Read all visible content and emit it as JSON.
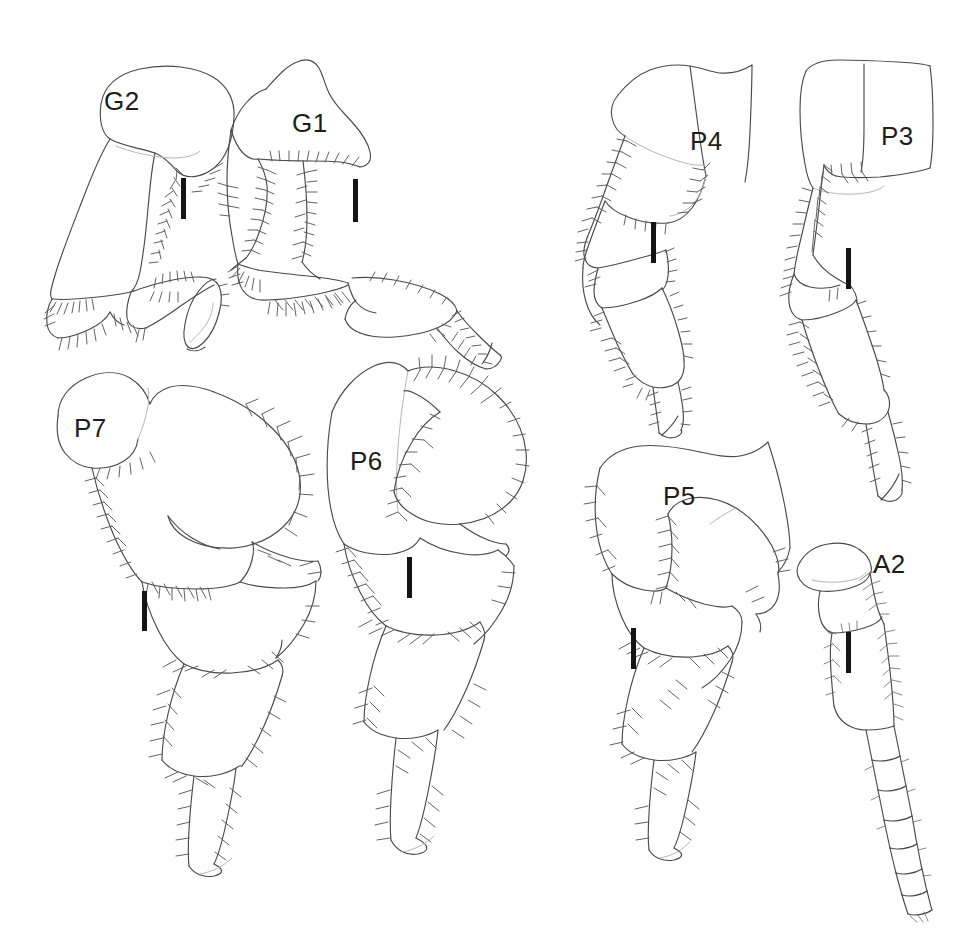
{
  "plate": {
    "title": "Amphipod appendage plate",
    "background_color": "#ffffff",
    "ink_color": "#4a4a4a",
    "scalebar_color": "#141414",
    "width": 970,
    "height": 948,
    "panel_count": 8
  },
  "panels": [
    {
      "id": "g2",
      "label": "G2",
      "name": "gnathopod-2",
      "label_x": 104,
      "label_y": 88,
      "scalebar": {
        "x": 181,
        "y": 178,
        "width": 5,
        "height": 41
      }
    },
    {
      "id": "g1",
      "label": "G1",
      "name": "gnathopod-1",
      "label_x": 292,
      "label_y": 110,
      "scalebar": {
        "x": 353,
        "y": 179,
        "width": 5,
        "height": 43
      }
    },
    {
      "id": "p4",
      "label": "P4",
      "name": "pereopod-4",
      "label_x": 690,
      "label_y": 128,
      "scalebar": {
        "x": 651,
        "y": 222,
        "width": 5,
        "height": 41
      }
    },
    {
      "id": "p3",
      "label": "P3",
      "name": "pereopod-3",
      "label_x": 881,
      "label_y": 123,
      "scalebar": {
        "x": 846,
        "y": 248,
        "width": 5,
        "height": 41
      }
    },
    {
      "id": "p7",
      "label": "P7",
      "name": "pereopod-7",
      "label_x": 74,
      "label_y": 415,
      "scalebar": {
        "x": 142,
        "y": 591,
        "width": 5,
        "height": 40
      }
    },
    {
      "id": "p6",
      "label": "P6",
      "name": "pereopod-6",
      "label_x": 350,
      "label_y": 448,
      "scalebar": {
        "x": 407,
        "y": 557,
        "width": 5,
        "height": 41
      }
    },
    {
      "id": "p5",
      "label": "P5",
      "name": "pereopod-5",
      "label_x": 663,
      "label_y": 483,
      "scalebar": {
        "x": 631,
        "y": 628,
        "width": 5,
        "height": 41
      }
    },
    {
      "id": "a2",
      "label": "A2",
      "name": "antenna-2",
      "label_x": 873,
      "label_y": 551,
      "scalebar": {
        "x": 846,
        "y": 632,
        "width": 5,
        "height": 41
      }
    }
  ]
}
